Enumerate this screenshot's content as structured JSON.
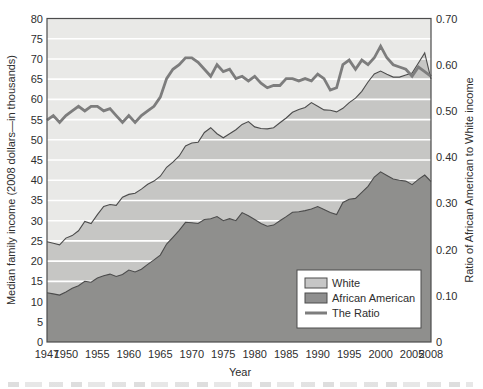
{
  "axes": {
    "left_title": "Median family income (2008 dollars—in thousands)",
    "right_title": "Ratio of African American to White income",
    "bottom_title": "Year",
    "left_tick_labels": [
      "0",
      "5",
      "10",
      "15",
      "20",
      "25",
      "30",
      "35",
      "40",
      "45",
      "50",
      "55",
      "60",
      "65",
      "70",
      "75",
      "80"
    ],
    "left_tick_values": [
      0,
      5,
      10,
      15,
      20,
      25,
      30,
      35,
      40,
      45,
      50,
      55,
      60,
      65,
      70,
      75,
      80
    ],
    "right_tick_labels": [
      "0",
      "0.10",
      "0.20",
      "0.30",
      "0.40",
      "0.50",
      "0.60",
      "0.70"
    ],
    "right_tick_values": [
      0,
      0.1,
      0.2,
      0.3,
      0.4,
      0.5,
      0.6,
      0.7
    ],
    "x_tick_labels": [
      "1947",
      "1950",
      "1955",
      "1960",
      "1965",
      "1970",
      "1975",
      "1980",
      "1985",
      "1990",
      "1995",
      "2000",
      "2005",
      "2008"
    ],
    "x_tick_values": [
      1947,
      1950,
      1955,
      1960,
      1965,
      1970,
      1975,
      1980,
      1985,
      1990,
      1995,
      2000,
      2005,
      2008
    ]
  },
  "legend": {
    "items": [
      {
        "key": "white",
        "label": "White",
        "swatch": "area",
        "color": "#c6c6c6"
      },
      {
        "key": "african-american",
        "label": "African American",
        "swatch": "area",
        "color": "#8f8f8f"
      },
      {
        "key": "the-ratio",
        "label": "The Ratio",
        "swatch": "line",
        "color": "#7d7d7d"
      }
    ]
  },
  "colors": {
    "plot_background": "#e9e9e7",
    "white_area": "#c6c6c4",
    "african_american_area": "#8f8f8d",
    "ratio_line": "#7d7d7d",
    "area_edge": "#4c4c4c",
    "gridline": "#ffffff",
    "frame": "#4c4c4c",
    "text": "#2e2e2e",
    "legend_background": "#ffffff"
  },
  "chart_data": {
    "type": "area",
    "subtype": "two overlapping areas from zero plus secondary-axis line",
    "x_label": "Year",
    "x": [
      1947,
      1948,
      1949,
      1950,
      1951,
      1952,
      1953,
      1954,
      1955,
      1956,
      1957,
      1958,
      1959,
      1960,
      1961,
      1962,
      1963,
      1964,
      1965,
      1966,
      1967,
      1968,
      1969,
      1970,
      1971,
      1972,
      1973,
      1974,
      1975,
      1976,
      1977,
      1978,
      1979,
      1980,
      1981,
      1982,
      1983,
      1984,
      1985,
      1986,
      1987,
      1988,
      1989,
      1990,
      1991,
      1992,
      1993,
      1994,
      1995,
      1996,
      1997,
      1998,
      1999,
      2000,
      2001,
      2002,
      2003,
      2004,
      2005,
      2006,
      2007,
      2008
    ],
    "series": [
      {
        "name": "White",
        "type": "area",
        "axis": "left",
        "color": "#c6c6c4",
        "values": [
          24.8,
          24.4,
          24.0,
          25.7,
          26.3,
          27.5,
          29.8,
          29.3,
          31.5,
          33.5,
          34.0,
          33.8,
          35.8,
          36.5,
          36.8,
          37.8,
          39.0,
          39.8,
          41.0,
          43.2,
          44.5,
          46.0,
          48.5,
          49.2,
          49.4,
          51.8,
          53.0,
          51.5,
          50.5,
          51.5,
          52.5,
          53.8,
          54.5,
          53.2,
          52.8,
          52.7,
          53.0,
          54.2,
          55.4,
          56.8,
          57.5,
          58.0,
          59.2,
          58.3,
          57.4,
          57.3,
          56.9,
          57.8,
          59.2,
          60.3,
          62.0,
          64.3,
          66.3,
          67.0,
          66.2,
          65.5,
          65.5,
          66.0,
          66.5,
          69.0,
          71.5,
          65.0
        ]
      },
      {
        "name": "African American",
        "type": "area",
        "axis": "left",
        "color": "#8f8f8d",
        "values": [
          12.2,
          11.9,
          11.6,
          12.4,
          13.3,
          13.9,
          15.0,
          14.8,
          15.8,
          16.4,
          16.8,
          16.2,
          16.7,
          17.8,
          17.3,
          18.0,
          19.2,
          20.3,
          21.5,
          24.2,
          25.9,
          27.6,
          29.6,
          29.5,
          29.3,
          30.3,
          30.5,
          31.0,
          30.0,
          30.5,
          30.0,
          32.0,
          31.2,
          30.3,
          29.3,
          28.6,
          28.9,
          30.0,
          31.0,
          32.1,
          32.2,
          32.5,
          32.9,
          33.5,
          32.8,
          32.0,
          31.5,
          34.5,
          35.3,
          35.5,
          37.0,
          38.5,
          40.8,
          42.1,
          41.2,
          40.3,
          40.0,
          39.8,
          38.9,
          40.2,
          41.3,
          39.7
        ]
      },
      {
        "name": "The Ratio",
        "type": "line",
        "axis": "right",
        "color": "#7d7d7d",
        "values": [
          0.48,
          0.49,
          0.475,
          0.49,
          0.5,
          0.51,
          0.5,
          0.51,
          0.51,
          0.5,
          0.505,
          0.49,
          0.475,
          0.49,
          0.475,
          0.49,
          0.5,
          0.51,
          0.53,
          0.57,
          0.59,
          0.6,
          0.615,
          0.615,
          0.605,
          0.59,
          0.575,
          0.6,
          0.585,
          0.59,
          0.57,
          0.575,
          0.565,
          0.575,
          0.56,
          0.55,
          0.555,
          0.555,
          0.57,
          0.57,
          0.565,
          0.57,
          0.565,
          0.58,
          0.57,
          0.545,
          0.55,
          0.6,
          0.61,
          0.59,
          0.61,
          0.6,
          0.615,
          0.64,
          0.615,
          0.6,
          0.595,
          0.59,
          0.575,
          0.595,
          0.585,
          0.575
        ]
      }
    ],
    "left_axis": {
      "label": "Median family income (2008 dollars—in thousands)",
      "min": 0,
      "max": 80,
      "tick_step": 5
    },
    "right_axis": {
      "label": "Ratio of African American to White income",
      "min": 0,
      "max": 0.7,
      "tick_step": 0.1
    },
    "x_axis": {
      "label": "Year",
      "min": 1947,
      "max": 2008,
      "tick_values": [
        1947,
        1950,
        1955,
        1960,
        1965,
        1970,
        1975,
        1980,
        1985,
        1990,
        1995,
        2000,
        2005,
        2008
      ]
    },
    "grid": {
      "horizontal": true,
      "color": "#ffffff",
      "interval_left_axis_units": 5
    },
    "legend_position": "inside plot, lower right"
  }
}
